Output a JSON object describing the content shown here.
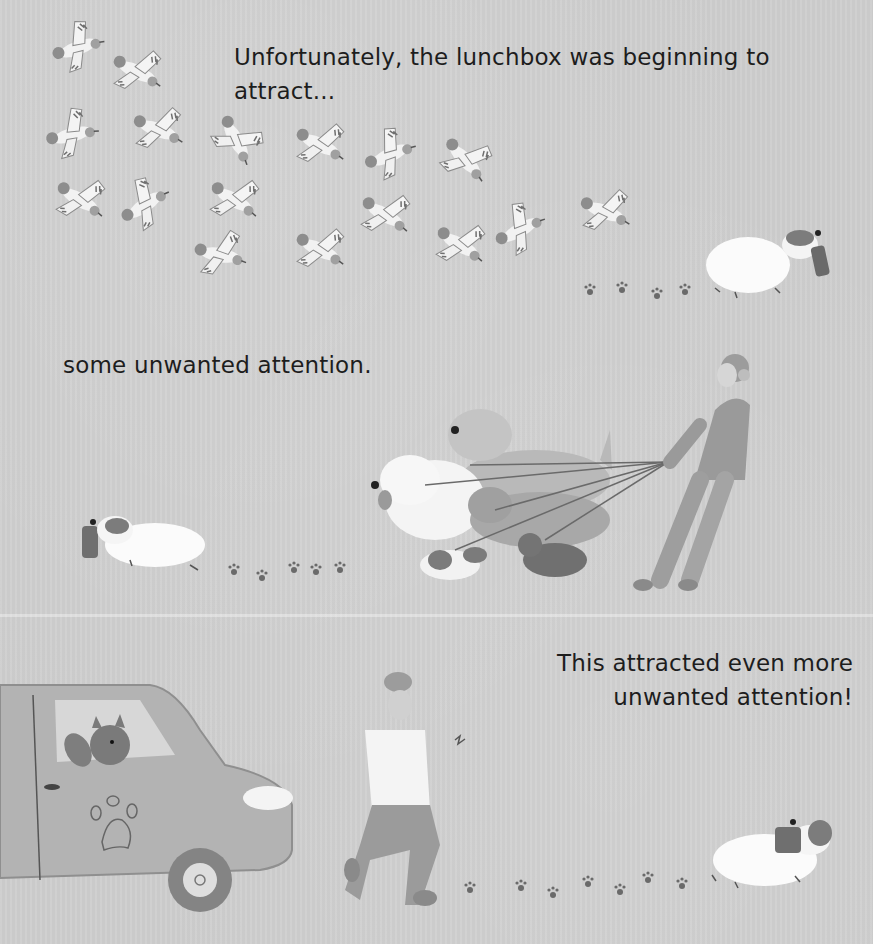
{
  "page": {
    "type": "picture-book-spread",
    "color_mode": "grayscale",
    "background_color": "#cecece"
  },
  "captions": {
    "top": "Unfortunately, the lunchbox was beginning to attract...",
    "middle": "some unwanted attention.",
    "bottom_line1": "This attracted even more",
    "bottom_line2": "unwanted attention!"
  },
  "scenes": {
    "top": {
      "description": "Flock of birds chasing a white dog carrying a lunchbox",
      "bird_count": 20,
      "paw_prints": 4
    },
    "middle": {
      "description": "Dog with lunchbox runs past a dog walker being pulled by five leashed dogs",
      "leashed_dogs": 5,
      "paw_prints": 5
    },
    "bottom": {
      "description": "Van with a paw logo and a dog in the window, a running man, and the dog with the lunchbox",
      "paw_prints": 8
    }
  }
}
